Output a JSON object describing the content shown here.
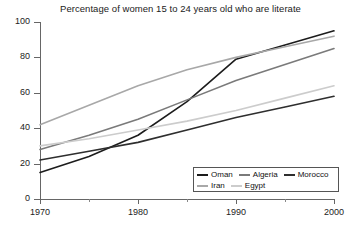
{
  "chart_data": {
    "type": "line",
    "title": "Percentage of women 15 to 24 years old who are literate",
    "xlabel": "",
    "ylabel": "",
    "xlim": [
      1970,
      2000
    ],
    "ylim": [
      0,
      100
    ],
    "x_ticks": [
      "1970",
      "1980",
      "1990",
      "2000"
    ],
    "x_tick_values": [
      1970,
      1980,
      1990,
      2000
    ],
    "x_minor_tick_values": [
      1975,
      1985,
      1995
    ],
    "y_ticks": [
      "0",
      "20",
      "40",
      "60",
      "80",
      "100"
    ],
    "y_tick_values": [
      0,
      20,
      40,
      60,
      80,
      100
    ],
    "grid": false,
    "legend_position": "bottom-right",
    "x": [
      1970,
      1975,
      1980,
      1985,
      1990,
      1995,
      2000
    ],
    "series": [
      {
        "name": "Oman",
        "color": "#1c1c1c",
        "values": [
          15,
          24,
          36,
          55,
          79,
          87,
          95
        ]
      },
      {
        "name": "Algeria",
        "color": "#7a7a7a",
        "values": [
          28,
          36,
          45,
          56,
          67,
          76,
          85
        ]
      },
      {
        "name": "Morocco",
        "color": "#2e2e2e",
        "values": [
          22,
          27,
          32,
          39,
          46,
          52,
          58
        ]
      },
      {
        "name": "Iran",
        "color": "#a8a8a8",
        "values": [
          42,
          53,
          64,
          73,
          80,
          86,
          92
        ]
      },
      {
        "name": "Egypt",
        "color": "#cccccc",
        "values": [
          30,
          34,
          39,
          44,
          50,
          57,
          64
        ]
      }
    ],
    "legend_rows": [
      [
        "Oman",
        "Algeria",
        "Morocco"
      ],
      [
        "Iran",
        "Egypt"
      ]
    ]
  },
  "colors": {
    "axis": "#666666",
    "text": "#222222",
    "background": "#ffffff",
    "legend_border": "#555555"
  }
}
